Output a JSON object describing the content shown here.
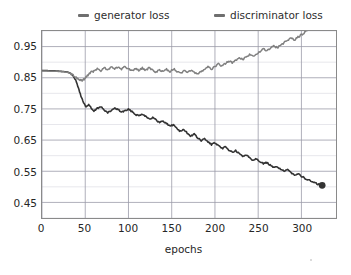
{
  "chart_data": {
    "type": "line",
    "title": "",
    "xlabel": "epochs",
    "ylabel": "",
    "grid": true,
    "legend_position": "above-plot",
    "xlim": [
      0,
      340
    ],
    "ylim": [
      0.4,
      1.0
    ],
    "xticks": [
      0,
      50,
      100,
      150,
      200,
      250,
      300
    ],
    "yticks": [
      0.45,
      0.55,
      0.65,
      0.75,
      0.85,
      0.95
    ],
    "ytick_labels": [
      "0.45",
      "0.55",
      "0.65",
      "0.75",
      "0.85",
      "0.95"
    ],
    "xtick_labels": [
      "0",
      "50",
      "100",
      "150",
      "200",
      "250",
      "300"
    ],
    "minor_y_gridline_step": 0.05,
    "series": [
      {
        "name": "generator loss",
        "color": "#333333",
        "linewidth": 1.6,
        "end_marker": true,
        "x": [
          0,
          5,
          10,
          15,
          20,
          25,
          30,
          33,
          36,
          39,
          42,
          45,
          48,
          51,
          54,
          57,
          60,
          64,
          68,
          72,
          76,
          80,
          84,
          88,
          92,
          96,
          100,
          104,
          108,
          112,
          116,
          120,
          124,
          128,
          132,
          136,
          140,
          144,
          148,
          152,
          156,
          160,
          164,
          168,
          172,
          176,
          180,
          184,
          188,
          192,
          196,
          200,
          204,
          208,
          212,
          216,
          220,
          224,
          228,
          232,
          236,
          240,
          244,
          248,
          252,
          256,
          260,
          264,
          268,
          272,
          276,
          280,
          284,
          288,
          292,
          296,
          300,
          304,
          308,
          312,
          316,
          320,
          324
        ],
        "y": [
          0.873,
          0.873,
          0.872,
          0.872,
          0.871,
          0.87,
          0.868,
          0.864,
          0.856,
          0.841,
          0.818,
          0.792,
          0.77,
          0.757,
          0.764,
          0.752,
          0.742,
          0.752,
          0.758,
          0.746,
          0.737,
          0.745,
          0.752,
          0.748,
          0.74,
          0.744,
          0.748,
          0.742,
          0.733,
          0.728,
          0.734,
          0.727,
          0.718,
          0.722,
          0.714,
          0.706,
          0.712,
          0.703,
          0.695,
          0.699,
          0.688,
          0.678,
          0.684,
          0.672,
          0.663,
          0.669,
          0.657,
          0.648,
          0.654,
          0.644,
          0.636,
          0.641,
          0.631,
          0.623,
          0.628,
          0.619,
          0.611,
          0.616,
          0.606,
          0.598,
          0.603,
          0.594,
          0.586,
          0.591,
          0.582,
          0.574,
          0.578,
          0.569,
          0.561,
          0.565,
          0.557,
          0.55,
          0.554,
          0.546,
          0.539,
          0.542,
          0.534,
          0.527,
          0.522,
          0.517,
          0.512,
          0.508,
          0.505
        ]
      },
      {
        "name": "discriminator loss",
        "color": "#808080",
        "linewidth": 1.5,
        "end_marker": false,
        "x": [
          0,
          5,
          10,
          15,
          20,
          25,
          30,
          33,
          36,
          39,
          42,
          45,
          48,
          51,
          54,
          57,
          60,
          64,
          68,
          72,
          76,
          80,
          84,
          88,
          92,
          96,
          100,
          104,
          108,
          112,
          116,
          120,
          124,
          128,
          132,
          136,
          140,
          144,
          148,
          152,
          156,
          160,
          164,
          168,
          172,
          176,
          180,
          184,
          188,
          192,
          196,
          200,
          204,
          208,
          212,
          216,
          220,
          224,
          228,
          232,
          236,
          240,
          244,
          248,
          252,
          256,
          260,
          264,
          268,
          272,
          276,
          280,
          284,
          288,
          292,
          296,
          300,
          304,
          308,
          312,
          316,
          320
        ],
        "y": [
          0.872,
          0.872,
          0.871,
          0.871,
          0.87,
          0.869,
          0.867,
          0.864,
          0.859,
          0.852,
          0.845,
          0.84,
          0.844,
          0.852,
          0.861,
          0.868,
          0.872,
          0.879,
          0.873,
          0.882,
          0.876,
          0.884,
          0.877,
          0.885,
          0.878,
          0.886,
          0.879,
          0.872,
          0.88,
          0.873,
          0.881,
          0.874,
          0.882,
          0.875,
          0.868,
          0.876,
          0.869,
          0.877,
          0.87,
          0.878,
          0.871,
          0.864,
          0.872,
          0.866,
          0.874,
          0.867,
          0.861,
          0.869,
          0.876,
          0.884,
          0.878,
          0.886,
          0.894,
          0.888,
          0.896,
          0.904,
          0.898,
          0.906,
          0.914,
          0.908,
          0.916,
          0.924,
          0.918,
          0.926,
          0.934,
          0.942,
          0.936,
          0.944,
          0.952,
          0.946,
          0.954,
          0.962,
          0.97,
          0.978,
          0.972,
          0.98,
          0.988,
          0.996,
          1.004,
          1.012,
          1.02,
          1.028
        ]
      }
    ]
  },
  "legend": {
    "entries": [
      {
        "label": "generator loss",
        "color": "#6f6f6f"
      },
      {
        "label": "discriminator loss",
        "color": "#6f6f6f"
      }
    ]
  },
  "axis": {
    "xlabel": "epochs"
  },
  "style": {
    "plot_border_color": "#8a8a8a",
    "major_gridline_color": "#9a9aa8",
    "minor_gridline_color": "#dcdce4",
    "background": "#ffffff",
    "tick_text_color": "#262626"
  }
}
